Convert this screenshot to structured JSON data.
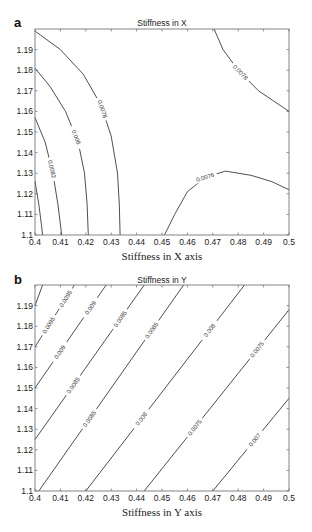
{
  "chart_data": [
    {
      "panel": "a",
      "type": "contour",
      "title": "Stiffness in X",
      "xlabel": "Stiffness in X axis",
      "ylabel": "",
      "xlim": [
        0.4,
        0.5
      ],
      "ylim": [
        1.1,
        1.2
      ],
      "xticks": [
        "0.4",
        "0.41",
        "0.42",
        "0.43",
        "0.44",
        "0.45",
        "0.46",
        "0.47",
        "0.48",
        "0.49",
        "0.5"
      ],
      "yticks": [
        "1.1",
        "1.11",
        "1.12",
        "1.13",
        "1.14",
        "1.15",
        "1.16",
        "1.17",
        "1.18",
        "1.19"
      ],
      "grid": false,
      "contours": [
        {
          "level": "0.0084",
          "labeled": false,
          "points": [
            [
              0.4,
              1.126
            ],
            [
              0.4015,
              1.115
            ],
            [
              0.4025,
              1.105
            ],
            [
              0.403,
              1.1
            ]
          ]
        },
        {
          "level": "0.0082",
          "labeled": true,
          "points": [
            [
              0.4,
              1.157
            ],
            [
              0.404,
              1.145
            ],
            [
              0.407,
              1.13
            ],
            [
              0.409,
              1.115
            ],
            [
              0.4105,
              1.1
            ]
          ]
        },
        {
          "level": "0.008",
          "labeled": true,
          "points": [
            [
              0.4,
              1.181
            ],
            [
              0.406,
              1.172
            ],
            [
              0.412,
              1.16
            ],
            [
              0.417,
              1.145
            ],
            [
              0.4195,
              1.13
            ],
            [
              0.4205,
              1.115
            ],
            [
              0.421,
              1.1
            ]
          ]
        },
        {
          "level": "0.0078",
          "labeled": true,
          "points": [
            [
              0.4,
              1.199
            ],
            [
              0.41,
              1.19
            ],
            [
              0.419,
              1.178
            ],
            [
              0.426,
              1.163
            ],
            [
              0.43,
              1.148
            ],
            [
              0.4325,
              1.13
            ],
            [
              0.4332,
              1.115
            ],
            [
              0.4335,
              1.1
            ]
          ]
        },
        {
          "level": "0.0078",
          "labeled": true,
          "points": [
            [
              0.4705,
              1.2
            ],
            [
              0.474,
              1.19
            ],
            [
              0.48,
              1.18
            ],
            [
              0.488,
              1.17
            ],
            [
              0.494,
              1.165
            ],
            [
              0.5,
              1.16
            ]
          ]
        },
        {
          "level": "0.0076",
          "labeled": true,
          "points": [
            [
              0.451,
              1.1
            ],
            [
              0.455,
              1.11
            ],
            [
              0.46,
              1.121
            ],
            [
              0.467,
              1.128
            ],
            [
              0.475,
              1.131
            ],
            [
              0.485,
              1.129
            ],
            [
              0.493,
              1.126
            ],
            [
              0.5,
              1.122
            ]
          ]
        }
      ]
    },
    {
      "panel": "b",
      "type": "contour",
      "title": "Stiffness in Y",
      "xlabel": "Stiffness in Y axis",
      "ylabel": "",
      "xlim": [
        0.4,
        0.5
      ],
      "ylim": [
        1.1,
        1.2
      ],
      "xticks": [
        "0.4",
        "0.41",
        "0.42",
        "0.43",
        "0.44",
        "0.45",
        "0.46",
        "0.47",
        "0.48",
        "0.49",
        "0.5"
      ],
      "yticks": [
        "1.1",
        "1.11",
        "1.12",
        "1.13",
        "1.14",
        "1.15",
        "1.16",
        "1.17",
        "1.18",
        "1.19"
      ],
      "grid": false,
      "contours": [
        {
          "level": "0.01",
          "labeled": false,
          "points": [
            [
              0.4,
              1.19
            ],
            [
              0.403,
              1.2
            ]
          ]
        },
        {
          "level": "0.0095",
          "labeled": true,
          "points": [
            [
              0.4,
              1.17
            ],
            [
              0.4155,
              1.2
            ]
          ]
        },
        {
          "level": "0.009",
          "labeled": true,
          "points": [
            [
              0.4,
              1.15
            ],
            [
              0.428,
              1.2
            ]
          ]
        },
        {
          "level": "0.0085",
          "labeled": true,
          "points": [
            [
              0.4,
              1.125
            ],
            [
              0.443,
              1.2
            ]
          ]
        },
        {
          "level": "0.0085",
          "labeled": true,
          "points": [
            [
              0.4015,
              1.1
            ],
            [
              0.4585,
              1.2
            ]
          ]
        },
        {
          "level": "0.008",
          "labeled": true,
          "points": [
            [
              0.42,
              1.1
            ],
            [
              0.4825,
              1.2
            ]
          ]
        },
        {
          "level": "0.0075",
          "labeled": true,
          "points": [
            [
              0.443,
              1.1
            ],
            [
              0.5,
              1.188
            ]
          ]
        },
        {
          "level": "0.007",
          "labeled": true,
          "points": [
            [
              0.47,
              1.1
            ],
            [
              0.5,
              1.145
            ]
          ]
        }
      ],
      "label_texts": [
        "0.0095",
        "0.009",
        "0.0085",
        "0.0085",
        "0.008",
        "0.008",
        "0.0075",
        "0.0075",
        "0.0075",
        "0.007",
        "0.009"
      ]
    }
  ],
  "panels": {
    "a": {
      "letter": "a",
      "title": "Stiffness in X",
      "xlabel": "Stiffness in X axis"
    },
    "b": {
      "letter": "b",
      "title": "Stiffness in Y",
      "xlabel": "Stiffness in Y axis"
    }
  }
}
